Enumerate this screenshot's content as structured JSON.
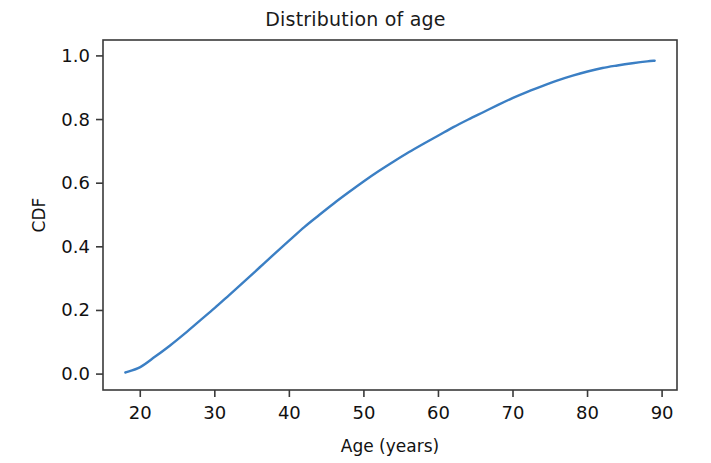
{
  "chart_data": {
    "type": "line",
    "title": "Distribution of age",
    "xlabel": "Age (years)",
    "ylabel": "CDF",
    "xlim": [
      15.0,
      92.0
    ],
    "ylim": [
      -0.05,
      1.05
    ],
    "xticks": [
      20,
      30,
      40,
      50,
      60,
      70,
      80,
      90
    ],
    "xticklabels": [
      "20",
      "30",
      "40",
      "50",
      "60",
      "70",
      "80",
      "90"
    ],
    "yticks": [
      0.0,
      0.2,
      0.4,
      0.6,
      0.8,
      1.0
    ],
    "yticklabels": [
      "0.0",
      "0.2",
      "0.4",
      "0.6",
      "0.8",
      "1.0"
    ],
    "grid": false,
    "legend": null,
    "line_color": "#3b7fc4",
    "line_width": 2.4,
    "series": [
      {
        "name": "CDF of age",
        "x": [
          18,
          20,
          22,
          24,
          26,
          28,
          30,
          32,
          34,
          36,
          38,
          40,
          42,
          44,
          46,
          48,
          50,
          52,
          54,
          56,
          58,
          60,
          62,
          64,
          66,
          68,
          70,
          72,
          74,
          76,
          78,
          80,
          82,
          84,
          86,
          88,
          89
        ],
        "y": [
          0.005,
          0.022,
          0.055,
          0.09,
          0.128,
          0.168,
          0.208,
          0.25,
          0.292,
          0.335,
          0.378,
          0.42,
          0.462,
          0.5,
          0.537,
          0.572,
          0.606,
          0.638,
          0.668,
          0.697,
          0.724,
          0.75,
          0.776,
          0.8,
          0.823,
          0.846,
          0.868,
          0.888,
          0.906,
          0.923,
          0.938,
          0.951,
          0.962,
          0.97,
          0.977,
          0.983,
          0.985
        ]
      }
    ]
  },
  "axes": {
    "spine_color": "#3a3a3a",
    "tick_color": "#3a3a3a"
  }
}
